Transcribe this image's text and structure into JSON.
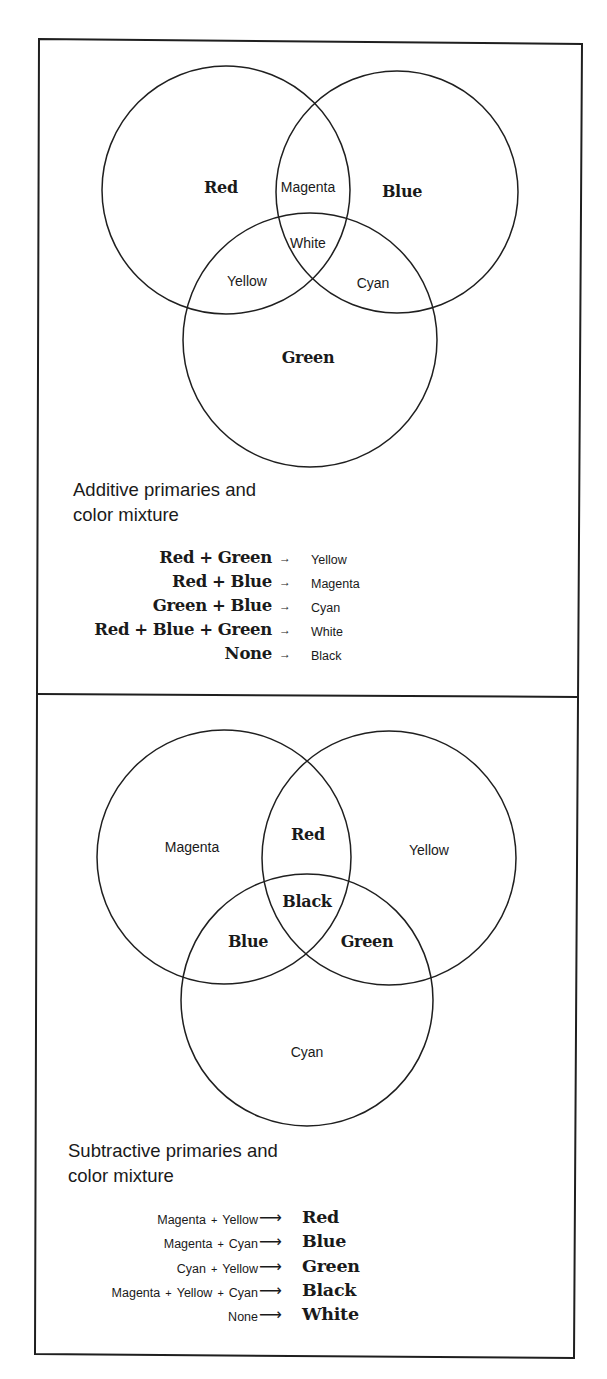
{
  "additive": {
    "venn": {
      "circles": [
        {
          "name": "Red",
          "cx": 226,
          "cy": 190,
          "r": 124
        },
        {
          "name": "Blue",
          "cx": 397,
          "cy": 192,
          "r": 121
        },
        {
          "name": "Green",
          "cx": 310,
          "cy": 340,
          "r": 127
        }
      ],
      "labels": {
        "red": "Red",
        "blue": "Blue",
        "green": "Green",
        "magenta": "Magenta",
        "yellow": "Yellow",
        "cyan": "Cyan",
        "white": "White"
      }
    },
    "caption": {
      "line1": "Additive primaries and",
      "line2": "color mixture"
    },
    "mixtures": [
      {
        "a": "Red",
        "op1": "+",
        "b": "Green",
        "op2": "",
        "c": "",
        "arrow": "→",
        "result": "Yellow"
      },
      {
        "a": "Red",
        "op1": "+",
        "b": "Blue",
        "op2": "",
        "c": "",
        "arrow": "→",
        "result": "Magenta"
      },
      {
        "a": "Green",
        "op1": "+",
        "b": "Blue",
        "op2": "",
        "c": "",
        "arrow": "→",
        "result": "Cyan"
      },
      {
        "a": "Red",
        "op1": "+",
        "b": "Blue",
        "op2": "+",
        "c": "Green",
        "arrow": "→",
        "result": "White"
      },
      {
        "a": "None",
        "op1": "",
        "b": "",
        "op2": "",
        "c": "",
        "arrow": "→",
        "result": "Black"
      }
    ]
  },
  "subtractive": {
    "venn": {
      "circles": [
        {
          "name": "Magenta",
          "cx": 224,
          "cy": 857,
          "r": 127
        },
        {
          "name": "Yellow",
          "cx": 389,
          "cy": 858,
          "r": 127
        },
        {
          "name": "Cyan",
          "cx": 307,
          "cy": 1000,
          "r": 126
        }
      ],
      "labels": {
        "magenta": "Magenta",
        "yellow": "Yellow",
        "cyan": "Cyan",
        "red": "Red",
        "blue": "Blue",
        "green": "Green",
        "black": "Black"
      }
    },
    "caption": {
      "line1": "Subtractive primaries and",
      "line2": "color mixture"
    },
    "mixtures": [
      {
        "a": "Magenta",
        "op1": "+",
        "b": "Yellow",
        "op2": "",
        "c": "",
        "arrow": "⟶",
        "result": "Red"
      },
      {
        "a": "Magenta",
        "op1": "+",
        "b": "Cyan",
        "op2": "",
        "c": "",
        "arrow": "⟶",
        "result": "Blue"
      },
      {
        "a": "Cyan",
        "op1": "+",
        "b": "Yellow",
        "op2": "",
        "c": "",
        "arrow": "⟶",
        "result": "Green"
      },
      {
        "a": "Magenta",
        "op1": "+",
        "b": "Yellow",
        "op2": "+",
        "c": "Cyan",
        "arrow": "⟶",
        "result": "Black"
      },
      {
        "a": "None",
        "op1": "",
        "b": "",
        "op2": "",
        "c": "",
        "arrow": "⟶",
        "result": "White"
      }
    ]
  }
}
